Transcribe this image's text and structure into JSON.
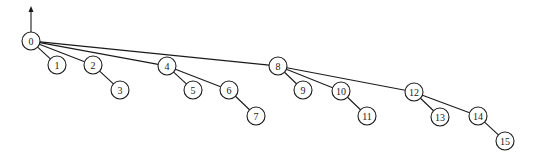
{
  "diagram": {
    "type": "binomial-tree",
    "order": 4,
    "stroke_color": "#1a1a1a",
    "background": "#ffffff",
    "node_radius": 9,
    "root_arrow": {
      "x": 31,
      "y_from": 32,
      "y_to": 6
    },
    "nodes": [
      {
        "id": 0,
        "label": "0",
        "x": 31,
        "y": 41
      },
      {
        "id": 1,
        "label": "1",
        "x": 57,
        "y": 65
      },
      {
        "id": 2,
        "label": "2",
        "x": 93,
        "y": 65
      },
      {
        "id": 3,
        "label": "3",
        "x": 120,
        "y": 90
      },
      {
        "id": 4,
        "label": "4",
        "x": 167,
        "y": 66
      },
      {
        "id": 5,
        "label": "5",
        "x": 193,
        "y": 90
      },
      {
        "id": 6,
        "label": "6",
        "x": 229,
        "y": 90
      },
      {
        "id": 7,
        "label": "7",
        "x": 256,
        "y": 116
      },
      {
        "id": 8,
        "label": "8",
        "x": 278,
        "y": 66
      },
      {
        "id": 9,
        "label": "9",
        "x": 303,
        "y": 90
      },
      {
        "id": 10,
        "label": "10",
        "x": 341,
        "y": 91
      },
      {
        "id": 11,
        "label": "11",
        "x": 367,
        "y": 116
      },
      {
        "id": 12,
        "label": "12",
        "x": 414,
        "y": 92
      },
      {
        "id": 13,
        "label": "13",
        "x": 440,
        "y": 117
      },
      {
        "id": 14,
        "label": "14",
        "x": 478,
        "y": 116
      },
      {
        "id": 15,
        "label": "15",
        "x": 505,
        "y": 141
      }
    ],
    "edges": [
      {
        "from": 0,
        "to": 1
      },
      {
        "from": 0,
        "to": 2
      },
      {
        "from": 0,
        "to": 4
      },
      {
        "from": 0,
        "to": 8
      },
      {
        "from": 2,
        "to": 3
      },
      {
        "from": 4,
        "to": 5
      },
      {
        "from": 4,
        "to": 6
      },
      {
        "from": 6,
        "to": 7
      },
      {
        "from": 8,
        "to": 9
      },
      {
        "from": 8,
        "to": 10
      },
      {
        "from": 8,
        "to": 12
      },
      {
        "from": 10,
        "to": 11
      },
      {
        "from": 12,
        "to": 13
      },
      {
        "from": 12,
        "to": 14
      },
      {
        "from": 14,
        "to": 15
      }
    ]
  }
}
